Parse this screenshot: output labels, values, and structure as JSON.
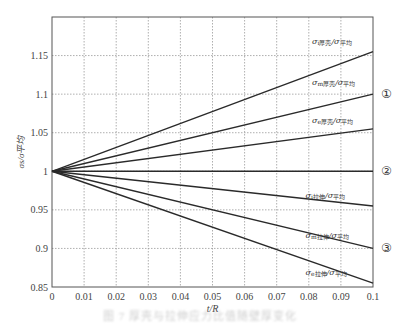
{
  "chart_data": {
    "type": "line",
    "title": "",
    "xlabel": "t/R",
    "ylabel": "σs/σ平均",
    "xlim": [
      0,
      0.1
    ],
    "ylim": [
      0.85,
      1.2
    ],
    "grid": true,
    "x_ticks": [
      "0",
      "0.01",
      "0.02",
      "0.03",
      "0.04",
      "0.05",
      "0.06",
      "0.07",
      "0.08",
      "0.09",
      "0.1"
    ],
    "y_ticks": [
      "0.85",
      "0.9",
      "0.95",
      "1",
      "1.05",
      "1.1",
      "1.15"
    ],
    "x": [
      0,
      0.1
    ],
    "series": [
      {
        "name": "σi厚壳/σ平均",
        "sub": "i",
        "kind": "厚壳",
        "values": [
          1.0,
          1.155
        ]
      },
      {
        "name": "σm厚壳/σ平均",
        "sub": "m",
        "kind": "厚壳",
        "values": [
          1.0,
          1.1
        ]
      },
      {
        "name": "σe厚壳/σ平均",
        "sub": "e",
        "kind": "厚壳",
        "values": [
          1.0,
          1.055
        ]
      },
      {
        "name": "baseline",
        "sub": "",
        "kind": "",
        "values": [
          1.0,
          1.0
        ]
      },
      {
        "name": "σi拉伸/σ平均",
        "sub": "i",
        "kind": "拉伸",
        "values": [
          1.0,
          0.955
        ]
      },
      {
        "name": "σm拉伸/σ平均",
        "sub": "m",
        "kind": "拉伸",
        "values": [
          1.0,
          0.9
        ]
      },
      {
        "name": "σe拉伸/σ平均",
        "sub": "e",
        "kind": "拉伸",
        "values": [
          1.0,
          0.855
        ]
      }
    ],
    "annotations": [
      {
        "text": "①",
        "y": 1.1
      },
      {
        "text": "②",
        "y": 1.0
      },
      {
        "text": "③",
        "y": 0.9
      }
    ],
    "label_positions": [
      {
        "series": 0,
        "x": 0.081,
        "y": 1.165
      },
      {
        "series": 1,
        "x": 0.081,
        "y": 1.112
      },
      {
        "series": 2,
        "x": 0.081,
        "y": 1.062
      },
      {
        "series": 4,
        "x": 0.079,
        "y": 0.966
      },
      {
        "series": 5,
        "x": 0.079,
        "y": 0.914
      },
      {
        "series": 6,
        "x": 0.079,
        "y": 0.866
      }
    ]
  },
  "caption": "图 7  厚壳与拉伸应力比值随壁厚变化"
}
